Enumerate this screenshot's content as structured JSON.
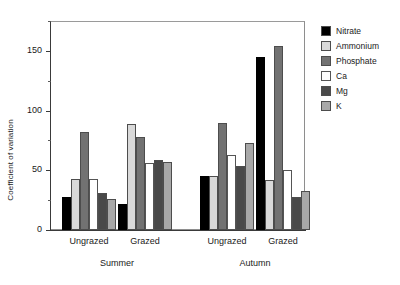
{
  "chart_data": {
    "type": "bar",
    "title": "",
    "subtitle": "",
    "xlabel": "",
    "ylabel": "Coefficient of variation",
    "ylim": [
      0,
      175
    ],
    "yticks": [
      0,
      50,
      100,
      150
    ],
    "ytick_labels": [
      "0",
      "50",
      "100",
      "150"
    ],
    "yminor_ticks": [
      25,
      75,
      125,
      175
    ],
    "grid": false,
    "legend_position": "right",
    "group_labels": [
      "Ungrazed",
      "Grazed",
      "Ungrazed",
      "Grazed"
    ],
    "season_labels": [
      "Summer",
      "Autumn"
    ],
    "categories": [
      "Summer Ungrazed",
      "Summer Grazed",
      "Autumn Ungrazed",
      "Autumn Grazed"
    ],
    "series": [
      {
        "name": "Nitrate",
        "color": "#000000",
        "values": [
          28,
          22,
          45,
          145
        ]
      },
      {
        "name": "Ammonium",
        "color": "#d9d9d9",
        "values": [
          43,
          89,
          45,
          42
        ]
      },
      {
        "name": "Phosphate",
        "color": "#727272",
        "values": [
          82,
          78,
          90,
          154
        ]
      },
      {
        "name": "Ca",
        "color": "#ffffff",
        "values": [
          43,
          56,
          63,
          50
        ]
      },
      {
        "name": "Mg",
        "color": "#494949",
        "values": [
          31,
          59,
          54,
          28
        ]
      },
      {
        "name": "K",
        "color": "#a8a8a8",
        "values": [
          26,
          57,
          73,
          33
        ]
      }
    ]
  },
  "legend": {
    "items": [
      {
        "label": "Nitrate",
        "color": "#000000"
      },
      {
        "label": "Ammonium",
        "color": "#d9d9d9"
      },
      {
        "label": "Phosphate",
        "color": "#727272"
      },
      {
        "label": "Ca",
        "color": "#ffffff"
      },
      {
        "label": "Mg",
        "color": "#494949"
      },
      {
        "label": "K",
        "color": "#a8a8a8"
      }
    ]
  }
}
